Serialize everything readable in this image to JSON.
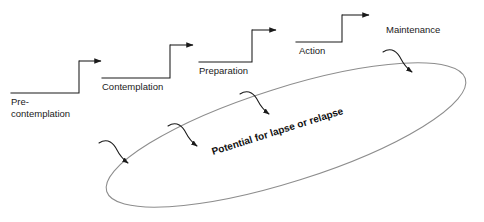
{
  "diagram": {
    "stages": [
      {
        "id": "precontemplation",
        "label_line1": "Pre-",
        "label_line2": "contemplation"
      },
      {
        "id": "contemplation",
        "label_line1": "Contemplation",
        "label_line2": ""
      },
      {
        "id": "preparation",
        "label_line1": "Preparation",
        "label_line2": ""
      },
      {
        "id": "action",
        "label_line1": "Action",
        "label_line2": ""
      },
      {
        "id": "maintenance",
        "label_line1": "Maintenance",
        "label_line2": ""
      }
    ],
    "relapse": {
      "label": "Potential for lapse or relapse"
    },
    "colors": {
      "background": "#ffffff",
      "line": "#1a1a1a",
      "ellipse": "#8d8d8d",
      "text": "#1a1a1a"
    }
  }
}
